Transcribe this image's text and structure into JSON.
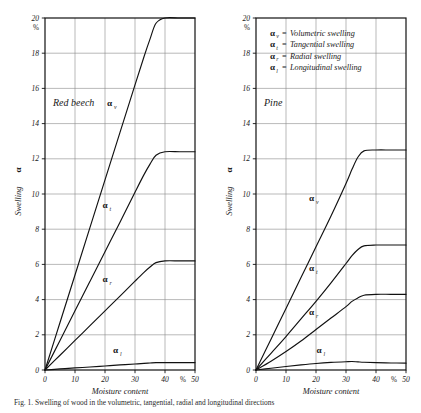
{
  "figure": {
    "caption": "Fig. 1. Swelling of wood in the volumetric, tangential, radial and longitudinal directions",
    "panels": [
      {
        "id": "red-beech",
        "species_label": "Red beech",
        "has_legend": false
      },
      {
        "id": "pine",
        "species_label": "Pine",
        "has_legend": true
      }
    ],
    "legend": {
      "entries": [
        {
          "symbol": "α",
          "subscript": "v",
          "separator": "=",
          "text": "Volumetric swelling"
        },
        {
          "symbol": "α",
          "subscript": "t",
          "separator": "=",
          "text": "Tangential swelling"
        },
        {
          "symbol": "α",
          "subscript": "r",
          "separator": "=",
          "text": "Radial swelling"
        },
        {
          "symbol": "α",
          "subscript": "l",
          "separator": "=",
          "text": "Longitudinal swelling"
        }
      ]
    },
    "axes": {
      "x_title": "Moisture content",
      "x_unit": "%",
      "y_title": "Swelling",
      "y_symbol": "α",
      "y_unit": "%",
      "x_ticks": [
        "0",
        "10",
        "20",
        "30",
        "40",
        "50"
      ],
      "y_ticks": [
        "0",
        "2",
        "4",
        "6",
        "8",
        "10",
        "12",
        "14",
        "16",
        "18",
        "20"
      ]
    },
    "colors": {
      "curve": "#111111",
      "frame": "#111111",
      "grid": "#8a8a8a",
      "background": "#ffffff",
      "text": "#1a1a1a"
    }
  },
  "chart_data": [
    {
      "type": "line",
      "title": "Red beech",
      "xlabel": "Moisture content",
      "ylabel": "Swelling",
      "xunit": "%",
      "yunit": "%",
      "xlim": [
        0,
        50
      ],
      "ylim": [
        0,
        20
      ],
      "xticks": [
        0,
        10,
        20,
        30,
        40,
        50
      ],
      "yticks": [
        0,
        2,
        4,
        6,
        8,
        10,
        12,
        14,
        16,
        18,
        20
      ],
      "grid": true,
      "legend_position": "none",
      "series": [
        {
          "name": "αv",
          "label": "Volumetric swelling",
          "saturation_value": 20.0,
          "saturation_moisture": 37,
          "x": [
            0,
            5,
            10,
            15,
            20,
            25,
            30,
            33,
            35,
            37,
            40,
            45,
            50
          ],
          "values": [
            0,
            2.7,
            5.4,
            8.1,
            10.8,
            13.5,
            16.2,
            17.8,
            18.8,
            19.7,
            20.0,
            20.0,
            20.0
          ]
        },
        {
          "name": "αt",
          "label": "Tangential swelling",
          "saturation_value": 12.4,
          "saturation_moisture": 37,
          "x": [
            0,
            5,
            10,
            15,
            20,
            25,
            30,
            33,
            35,
            37,
            40,
            45,
            50
          ],
          "values": [
            0,
            1.68,
            3.36,
            5.04,
            6.72,
            8.4,
            10.1,
            11.1,
            11.7,
            12.2,
            12.4,
            12.4,
            12.4
          ]
        },
        {
          "name": "αr",
          "label": "Radial swelling",
          "saturation_value": 6.2,
          "saturation_moisture": 37,
          "x": [
            0,
            5,
            10,
            15,
            20,
            25,
            30,
            33,
            35,
            37,
            40,
            45,
            50
          ],
          "values": [
            0,
            0.84,
            1.68,
            2.52,
            3.36,
            4.2,
            5.05,
            5.55,
            5.85,
            6.1,
            6.2,
            6.2,
            6.2
          ]
        },
        {
          "name": "αl",
          "label": "Longitudinal swelling",
          "saturation_value": 0.42,
          "saturation_moisture": 37,
          "x": [
            0,
            5,
            10,
            15,
            20,
            25,
            30,
            33,
            35,
            37,
            40,
            45,
            50
          ],
          "values": [
            0,
            0.06,
            0.12,
            0.17,
            0.23,
            0.29,
            0.34,
            0.38,
            0.4,
            0.42,
            0.42,
            0.42,
            0.42
          ]
        }
      ]
    },
    {
      "type": "line",
      "title": "Pine",
      "xlabel": "Moisture content",
      "ylabel": "Swelling",
      "xunit": "%",
      "yunit": "%",
      "xlim": [
        0,
        50
      ],
      "ylim": [
        0,
        20
      ],
      "xticks": [
        0,
        10,
        20,
        30,
        40,
        50
      ],
      "yticks": [
        0,
        2,
        4,
        6,
        8,
        10,
        12,
        14,
        16,
        18,
        20
      ],
      "grid": true,
      "legend_position": "top-right",
      "series": [
        {
          "name": "αv",
          "label": "Volumetric swelling",
          "saturation_value": 12.5,
          "saturation_moisture": 36,
          "x": [
            0,
            5,
            10,
            15,
            20,
            25,
            30,
            32,
            34,
            36,
            40,
            45,
            50
          ],
          "values": [
            0,
            1.75,
            3.5,
            5.25,
            7.0,
            8.75,
            10.6,
            11.4,
            12.1,
            12.45,
            12.5,
            12.5,
            12.5
          ]
        },
        {
          "name": "αt",
          "label": "Tangential swelling",
          "saturation_value": 7.1,
          "saturation_moisture": 36,
          "x": [
            0,
            5,
            10,
            15,
            20,
            25,
            30,
            32,
            34,
            36,
            40,
            45,
            50
          ],
          "values": [
            0,
            0.95,
            1.9,
            2.9,
            3.9,
            4.95,
            6.05,
            6.5,
            6.85,
            7.05,
            7.1,
            7.1,
            7.1
          ]
        },
        {
          "name": "αr",
          "label": "Radial swelling",
          "saturation_value": 4.3,
          "saturation_moisture": 36,
          "x": [
            0,
            5,
            10,
            15,
            20,
            25,
            30,
            32,
            34,
            36,
            40,
            45,
            50
          ],
          "values": [
            0,
            0.5,
            1.05,
            1.65,
            2.3,
            2.95,
            3.6,
            3.9,
            4.1,
            4.25,
            4.3,
            4.3,
            4.3
          ]
        },
        {
          "name": "αl",
          "label": "Longitudinal swelling",
          "saturation_value": 0.4,
          "saturation_moisture": 32,
          "x": [
            0,
            5,
            10,
            15,
            20,
            25,
            30,
            32,
            34,
            36,
            40,
            45,
            50
          ],
          "values": [
            0,
            0.1,
            0.2,
            0.29,
            0.37,
            0.43,
            0.47,
            0.48,
            0.46,
            0.44,
            0.42,
            0.4,
            0.39
          ]
        }
      ]
    }
  ]
}
